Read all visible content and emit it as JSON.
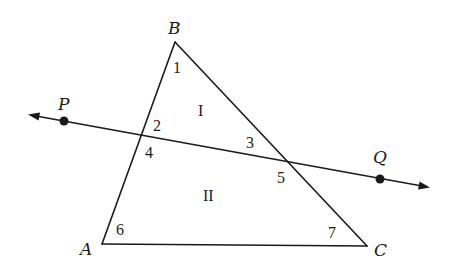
{
  "figure": {
    "type": "geometry-diagram",
    "triangle": {
      "vertices": {
        "A": {
          "label": "A",
          "x": 102,
          "y": 244
        },
        "B": {
          "label": "B",
          "x": 175,
          "y": 42
        },
        "C": {
          "label": "C",
          "x": 367,
          "y": 246
        }
      }
    },
    "line": {
      "name": "PQ",
      "points": {
        "P": {
          "label": "P",
          "x": 64,
          "y": 121
        },
        "Q": {
          "label": "Q",
          "x": 380,
          "y": 179
        }
      },
      "arrows": "both"
    },
    "angles": [
      {
        "id": "1",
        "label": "1"
      },
      {
        "id": "2",
        "label": "2"
      },
      {
        "id": "3",
        "label": "3"
      },
      {
        "id": "4",
        "label": "4"
      },
      {
        "id": "5",
        "label": "5"
      },
      {
        "id": "6",
        "label": "6"
      },
      {
        "id": "7",
        "label": "7"
      }
    ],
    "regions": [
      {
        "id": "I",
        "label": "I"
      },
      {
        "id": "II",
        "label": "II"
      }
    ]
  }
}
